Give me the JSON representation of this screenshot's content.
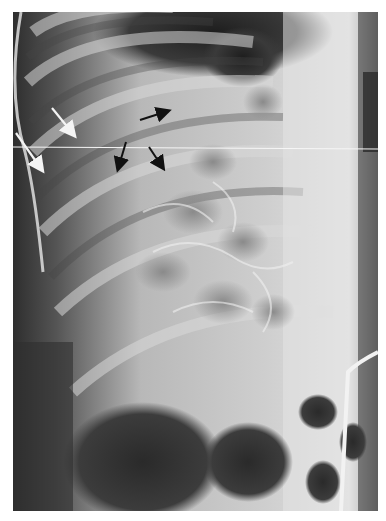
{
  "image": {
    "kind": "radiograph",
    "description": "Grayscale abdominal X-ray with white and black arrows",
    "annotations": {
      "white_arrows": [
        {
          "from": [
            52,
            108
          ],
          "to": [
            74,
            135
          ]
        },
        {
          "from": [
            16,
            133
          ],
          "to": [
            42,
            170
          ]
        }
      ],
      "black_arrows": [
        {
          "from": [
            140,
            120
          ],
          "to": [
            170,
            110
          ]
        },
        {
          "from": [
            126,
            142
          ],
          "to": [
            117,
            171
          ]
        },
        {
          "from": [
            149,
            147
          ],
          "to": [
            164,
            170
          ]
        }
      ]
    }
  }
}
